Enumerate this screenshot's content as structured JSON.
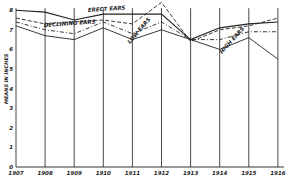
{
  "chart_data": {
    "type": "line",
    "title": "",
    "xlabel": "",
    "ylabel": "MEANS IN INCHES",
    "ylim": [
      0,
      8
    ],
    "yticks": [
      0,
      1,
      2,
      3,
      4,
      5,
      6,
      7,
      8
    ],
    "grid": "vertical lines at each year",
    "categories": [
      "1907",
      "1908",
      "1909",
      "1910",
      "1911",
      "1912",
      "1913",
      "1914",
      "1915",
      "1916"
    ],
    "series": [
      {
        "name": "ERECT EARS",
        "style": "solid",
        "values": [
          8.0,
          7.9,
          7.5,
          7.8,
          7.8,
          7.8,
          6.5,
          7.1,
          7.3,
          7.4
        ]
      },
      {
        "name": "DECLINING EARS",
        "style": "dashed",
        "values": [
          7.6,
          7.3,
          7.4,
          7.5,
          7.3,
          8.4,
          6.4,
          7.0,
          7.2,
          7.6
        ]
      },
      {
        "name": "LOW EARS",
        "style": "dash-dot",
        "values": [
          7.4,
          7.0,
          6.8,
          7.4,
          6.8,
          7.4,
          6.5,
          6.5,
          6.9,
          6.9
        ]
      },
      {
        "name": "HIGH EARS",
        "style": "solid",
        "values": [
          7.2,
          6.7,
          6.5,
          7.1,
          6.5,
          7.0,
          6.5,
          6.0,
          6.6,
          5.5
        ]
      }
    ],
    "annotations": [
      {
        "text": "ERECT EARS",
        "near": "1909-1910"
      },
      {
        "text": "DECLINING EARS",
        "near": "1908-1909"
      },
      {
        "text": "LOW EARS",
        "near": "1911"
      },
      {
        "text": "HIGH EARS",
        "near": "1914-1915"
      }
    ]
  }
}
